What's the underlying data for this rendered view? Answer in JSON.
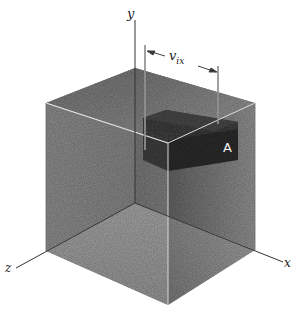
{
  "figure": {
    "type": "3d-box-diagram",
    "axes": {
      "x_label": "x",
      "y_label": "y",
      "z_label": "z"
    },
    "dimension_label": {
      "main": "v",
      "subscript": "ix"
    },
    "block_label": "A",
    "colors": {
      "background": "#ffffff",
      "left_wall": "#8a8a8a",
      "right_wall": "#9a9a9a",
      "floor": "#b8b8b8",
      "top_face": "#7c7c7c",
      "block_dark": "#3a3a3a",
      "line": "#333333"
    }
  }
}
